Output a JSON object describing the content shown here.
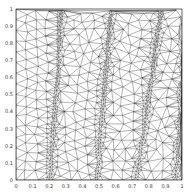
{
  "chart_data": {
    "type": "scatter",
    "title": "",
    "subtitle": "Triangular mesh with adaptive refinement bands",
    "xlabel": "",
    "ylabel": "",
    "xlim": [
      0,
      1
    ],
    "ylim": [
      0,
      1
    ],
    "x_ticks": [
      "0",
      "0.1",
      "0.2",
      "0.3",
      "0.4",
      "0.5",
      "0.6",
      "0.7",
      "0.8",
      "0.9",
      "1"
    ],
    "y_ticks": [
      "0",
      "0.1",
      "0.2",
      "0.3",
      "0.4",
      "0.5",
      "0.6",
      "0.7",
      "0.8",
      "0.9",
      "1"
    ],
    "grid": false,
    "legend": null,
    "refinement_bands": [
      {
        "x_top": 0.27,
        "x_bottom": 0.2
      },
      {
        "x_top": 0.57,
        "x_bottom": 0.48
      },
      {
        "x_top": 0.87,
        "x_bottom": 0.72
      },
      {
        "x_top": 1.02,
        "x_bottom": 0.96
      }
    ],
    "band_width": 0.06,
    "coarse_spacing": 0.062,
    "colors": {
      "edge": "#222222",
      "background": "#ffffff",
      "axis": "#000000"
    }
  }
}
